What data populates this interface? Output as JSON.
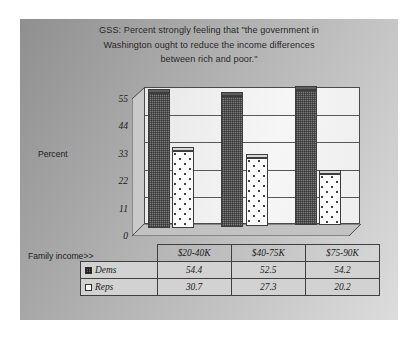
{
  "slide": {
    "title": "GSS:  Percent strongly feeling that \"the government in Washington ought to reduce the income differences between rich and poor.\"",
    "title_line1": "GSS:  Percent strongly feeling that \"the government in",
    "title_line2": "Washington ought to reduce the income differences",
    "title_line3": "between rich and poor.\"",
    "y_axis_title": "Percent",
    "x_axis_title": "Family income>>",
    "background_color": "#b4b4b4",
    "plot_background_color": "#f2f2f2",
    "dems_color": "#7d7d7d",
    "reps_color": "#fbfbfb"
  },
  "legend": {
    "dems_swatch": "crosshatch-swatch-icon",
    "reps_swatch": "dotted-swatch-icon",
    "dems_label": "Dems",
    "reps_label": "Reps"
  },
  "chart_data": {
    "type": "bar",
    "title": "GSS:  Percent strongly feeling that \"the government in Washington ought to reduce the income differences between rich and poor.\"",
    "xlabel": "Family income>>",
    "ylabel": "Percent",
    "categories": [
      "$20-40K",
      "$40-75K",
      "$75-90K"
    ],
    "series": [
      {
        "name": "Dems",
        "values": [
          54.4,
          52.5,
          54.2
        ]
      },
      {
        "name": "Reps",
        "values": [
          30.7,
          27.3,
          20.2
        ]
      }
    ],
    "ylim": [
      0,
      55
    ],
    "yticks": [
      0,
      11,
      22,
      33,
      44,
      55
    ],
    "ytick_labels": [
      "0",
      "11",
      "22",
      "33",
      "44",
      "55"
    ],
    "grid": true,
    "legend_position": "data-table-below"
  },
  "table": {
    "rows": [
      {
        "label": "Dems",
        "cells": [
          "54.4",
          "52.5",
          "54.2"
        ]
      },
      {
        "label": "Reps",
        "cells": [
          "30.7",
          "27.3",
          "20.2"
        ]
      }
    ]
  }
}
